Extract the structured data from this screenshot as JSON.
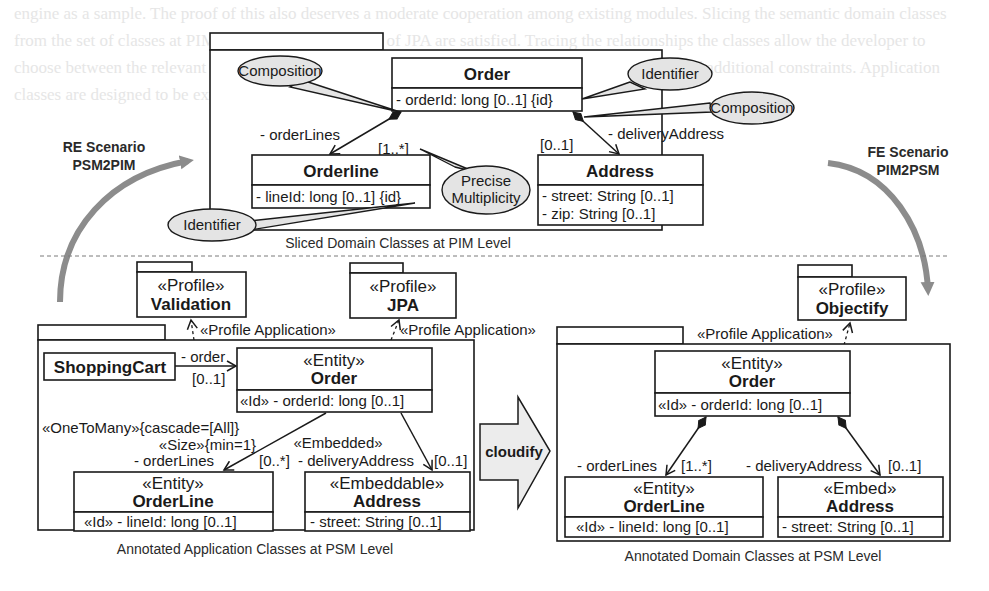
{
  "background_text": "engine as a sample. The proof of this also deserves a moderate cooperation among existing modules. Slicing the semantic domain classes from the set of classes at PIM for which all conditions of JPA are satisfied. Tracing the relationships the classes allow the developer to choose between the relevant target platforms and profiles. Ongoing work includes the introduction of additional constraints. Application classes are designed to be explicitly annotated and cloudified into the target PSM.",
  "scenarios": {
    "re": {
      "line1": "RE Scenario",
      "line2": "PSM2PIM"
    },
    "fe": {
      "line1": "FE Scenario",
      "line2": "PIM2PSM"
    }
  },
  "pim": {
    "caption": "Sliced Domain Classes at PIM Level",
    "order": {
      "name": "Order",
      "attrs": [
        "- orderId: long [0..1] {id}"
      ]
    },
    "orderline": {
      "name": "Orderline",
      "attrs": [
        "- lineId: long [0..1] {id}"
      ]
    },
    "address": {
      "name": "Address",
      "attrs": [
        "- street: String [0..1]",
        "- zip: String [0..1]"
      ]
    },
    "assoc_orderlines": {
      "role": "- orderLines",
      "mult": "[1..*]"
    },
    "assoc_delivery": {
      "role": "- deliveryAddress",
      "mult": "[0..1]"
    },
    "bubbles": {
      "composition_left": "Composition",
      "identifier_top": "Identifier",
      "composition_right": "Composition",
      "precise_line1": "Precise",
      "precise_line2": "Multiplicity",
      "identifier_bottom": "Identifier"
    }
  },
  "profiles": {
    "validation": {
      "stereotype": "«Profile»",
      "name": "Validation"
    },
    "jpa": {
      "stereotype": "«Profile»",
      "name": "JPA"
    },
    "objectify": {
      "stereotype": "«Profile»",
      "name": "Objectify"
    },
    "application_label": "«Profile Application»"
  },
  "psm_app": {
    "caption": "Annotated Application Classes at PSM Level",
    "shoppingcart": {
      "name": "ShoppingCart"
    },
    "assoc_order": {
      "role": "- order",
      "mult": "[0..1]"
    },
    "order": {
      "stereotype": "«Entity»",
      "name": "Order",
      "attrs": [
        "«Id» - orderId: long [0..1]"
      ]
    },
    "orderline_annot": {
      "line1": "«OneToMany»{cascade=[All]}",
      "line2": "«Size»{min=1}",
      "role": "- orderLines",
      "mult": "[0..*]"
    },
    "delivery_annot": {
      "stereotype": "«Embedded»",
      "role": "- deliveryAddress",
      "mult": "[0..1]"
    },
    "orderline": {
      "stereotype": "«Entity»",
      "name": "OrderLine",
      "attrs": [
        "«Id» - lineId: long [0..1]"
      ]
    },
    "address": {
      "stereotype": "«Embeddable»",
      "name": "Address",
      "attrs": [
        "- street: String [0..1]"
      ]
    }
  },
  "transform": {
    "label": "cloudify"
  },
  "psm_domain": {
    "caption": "Annotated Domain Classes at PSM Level",
    "order": {
      "stereotype": "«Entity»",
      "name": "Order",
      "attrs": [
        "«Id» - orderId: long [0..1]"
      ]
    },
    "assoc_orderlines": {
      "role": "- orderLines",
      "mult": "[1..*]"
    },
    "assoc_delivery": {
      "role": "- deliveryAddress",
      "mult": "[0..1]"
    },
    "orderline": {
      "stereotype": "«Entity»",
      "name": "OrderLine",
      "attrs": [
        "«Id» - lineId: long [0..1]"
      ]
    },
    "address": {
      "stereotype": "«Embed»",
      "name": "Address",
      "attrs": [
        "- street: String [0..1]"
      ]
    }
  },
  "colors": {
    "ink": "#1a1a1a",
    "bubble_fill": "#e4e4e4",
    "scenario_arrow": "#8c8c8c",
    "cloudify_fill": "#ececec",
    "separator": "#7a7a7a"
  }
}
